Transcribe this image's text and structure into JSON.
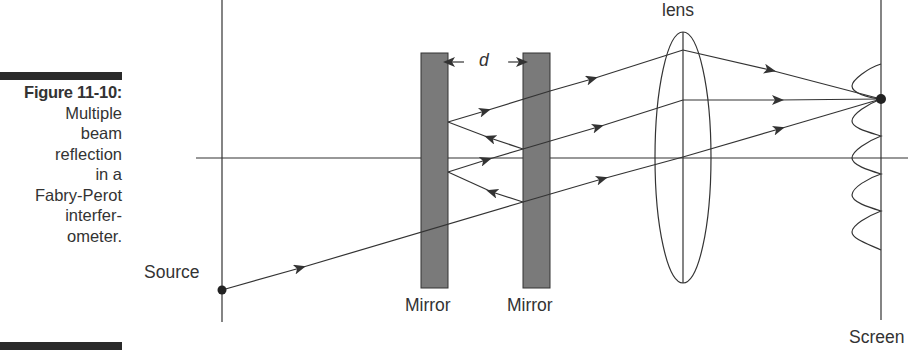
{
  "caption": {
    "figure_number": "Figure 11-10:",
    "lines": [
      "Multiple",
      "beam",
      "reflection",
      "in a",
      "Fabry-Perot",
      "interfer-",
      "ometer."
    ]
  },
  "labels": {
    "source": "Source",
    "mirror_left": "Mirror",
    "mirror_right": "Mirror",
    "lens": "lens",
    "screen": "Screen",
    "spacing": "d"
  },
  "colors": {
    "line": "#333333",
    "mirror_fill": "#7a7a7a",
    "text": "#333333",
    "caption_bar": "#2a2a2a"
  }
}
